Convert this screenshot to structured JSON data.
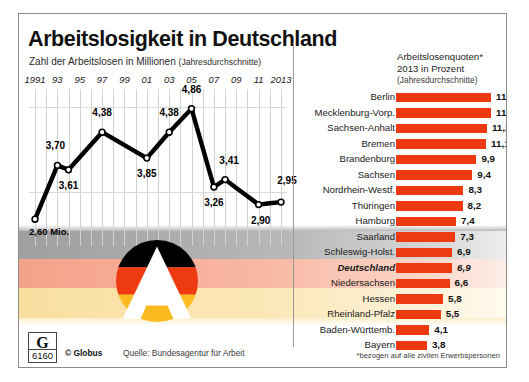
{
  "header": {
    "title": "Arbeitslosigkeit in Deutschland",
    "subtitle_main": "Zahl der Arbeitslosen in Millionen",
    "subtitle_paren": "(Jahresdurchschnitte)"
  },
  "right_header": {
    "line1": "Arbeitslosenquoten*",
    "line2": "2013 in Prozent",
    "line3": "(Jahresdurchschnitte)"
  },
  "footer": {
    "logo_letter": "G",
    "logo_number": "6160",
    "copyright": "© Globus",
    "source": "Quelle: Bundesagentur für Arbeit",
    "footnote": "*bezogen auf alle zivilen Erwerbspersonen"
  },
  "colors": {
    "bar_red": "#ee3a11",
    "line_black": "#000000",
    "grid": "#d2d2d2",
    "frame": "#8c8c8c",
    "flag_black": "#b4b4b4",
    "flag_red": "#f8b8a3",
    "flag_gold": "#fbe7b6"
  },
  "chart_data": [
    {
      "type": "line",
      "title": "Zahl der Arbeitslosen in Millionen (Jahresdurchschnitte)",
      "xlabel": "",
      "ylabel": "Millionen",
      "ylim": [
        2.4,
        5.1
      ],
      "grid": true,
      "legend": "none",
      "unit_label": "Mio.",
      "first_point_label": "2,60 Mio.",
      "tick_labels": [
        "1991",
        "93",
        "95",
        "97",
        "99",
        "01",
        "03",
        "05",
        "07",
        "09",
        "11",
        "2013"
      ],
      "x": [
        1991,
        1992,
        1993,
        1994,
        1995,
        1996,
        1997,
        1998,
        1999,
        2000,
        2001,
        2002,
        2003,
        2004,
        2005,
        2006,
        2007,
        2008,
        2009,
        2010,
        2011,
        2012,
        2013
      ],
      "values": [
        2.6,
        null,
        3.7,
        3.61,
        null,
        null,
        4.38,
        null,
        null,
        null,
        3.85,
        null,
        4.38,
        4.38,
        4.86,
        null,
        3.26,
        3.41,
        null,
        null,
        2.9,
        null,
        2.95
      ],
      "labeled_points": [
        {
          "year": 1991,
          "value": 2.6,
          "label": "2,60 Mio."
        },
        {
          "year": 1993,
          "value": 3.7,
          "label": "3,70"
        },
        {
          "year": 1994,
          "value": 3.61,
          "label": "3,61"
        },
        {
          "year": 1997,
          "value": 4.38,
          "label": "4,38"
        },
        {
          "year": 2001,
          "value": 3.85,
          "label": "3,85"
        },
        {
          "year": 2003,
          "value": 4.38,
          "label": "4,38"
        },
        {
          "year": 2005,
          "value": 4.86,
          "label": "4,86"
        },
        {
          "year": 2007,
          "value": 3.26,
          "label": "3,26"
        },
        {
          "year": 2008,
          "value": 3.41,
          "label": "3,41"
        },
        {
          "year": 2011,
          "value": 2.9,
          "label": "2,90"
        },
        {
          "year": 2013,
          "value": 2.95,
          "label": "2,95"
        }
      ]
    },
    {
      "type": "bar",
      "orientation": "horizontal",
      "title": "Arbeitslosenquoten* 2013 in Prozent (Jahresdurchschnitte)",
      "xlabel": "Prozent",
      "ylabel": "",
      "xlim": [
        0,
        12
      ],
      "unit_suffix": "%",
      "categories": [
        "Berlin",
        "Mecklenburg-Vorp.",
        "Sachsen-Anhalt",
        "Bremen",
        "Brandenburg",
        "Sachsen",
        "Nordrhein-Westf.",
        "Thüringen",
        "Hamburg",
        "Saarland",
        "Schleswig-Holst.",
        "Deutschland",
        "Niedersachsen",
        "Hessen",
        "Rheinland-Pfalz",
        "Baden-Württemb.",
        "Bayern"
      ],
      "values": [
        11.7,
        11.7,
        11.2,
        11.1,
        9.9,
        9.4,
        8.3,
        8.2,
        7.4,
        7.3,
        6.9,
        6.9,
        6.6,
        5.8,
        5.5,
        4.1,
        3.8
      ],
      "value_labels": [
        "11,7 %",
        "11,7",
        "11,2",
        "11,1",
        "9,9",
        "9,4",
        "8,3",
        "8,2",
        "7,4",
        "7,3",
        "6,9",
        "6,9",
        "6,6",
        "5,8",
        "5,5",
        "4,1",
        "3,8"
      ],
      "highlight_index": 11
    }
  ]
}
